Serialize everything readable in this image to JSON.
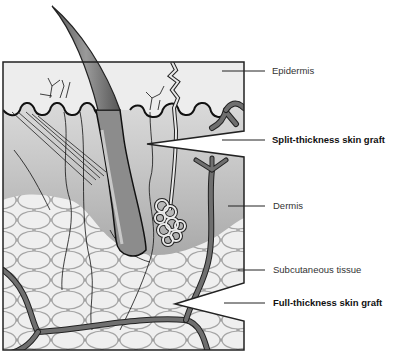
{
  "diagram": {
    "colors": {
      "epidermis": "#ececec",
      "dermis_top": "#d8d8d8",
      "dermis_bottom": "#8f8f8f",
      "fat_lobule": "#eeeeee",
      "fat_outline": "#a8a8a8",
      "vessel": "#6f6f6f",
      "outline": "#222222"
    }
  },
  "labels": {
    "epidermis": "Epidermis",
    "split_thickness": "Split-thickness skin graft",
    "dermis": "Dermis",
    "subcutaneous": "Subcutaneous tissue",
    "full_thickness": "Full-thickness skin graft"
  }
}
